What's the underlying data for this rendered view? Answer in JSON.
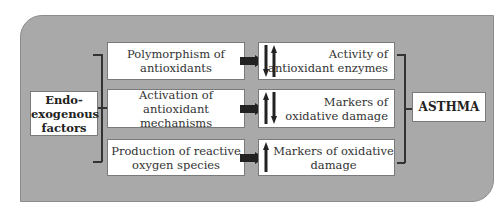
{
  "diagram": {
    "source": {
      "label": "Endo-exogenous factors",
      "lines": [
        "Endo-",
        "exogenous",
        "factors"
      ]
    },
    "processes": [
      {
        "label": "Polymorphism of antioxidants",
        "lines": [
          "Polymorphism of",
          "antioxidants"
        ]
      },
      {
        "label": "Activation of antioxidant mechanisms",
        "lines": [
          "Activation of",
          "antioxidant mechanisms"
        ]
      },
      {
        "label": "Production of reactive oxygen species",
        "lines": [
          "Production of reactive",
          "oxygen species"
        ]
      }
    ],
    "effects": [
      {
        "label": "Activity of antioxidant enzymes",
        "lines": [
          "Activity of",
          "antioxidant enzymes"
        ],
        "arrows": [
          "down",
          "up"
        ]
      },
      {
        "label": "Markers of oxidative damage",
        "lines": [
          "Markers of",
          "oxidative damage"
        ],
        "arrows": [
          "up",
          "down"
        ]
      },
      {
        "label": "Markers of oxidative damage",
        "lines": [
          "Markers of oxidative",
          "damage"
        ],
        "arrows": [
          "up"
        ]
      }
    ],
    "outcome": {
      "label": "ASTHMA"
    },
    "colors": {
      "panel": "#a9a9a9",
      "box": "#ffffff",
      "arrow": "#222222",
      "text": "#333333"
    }
  }
}
